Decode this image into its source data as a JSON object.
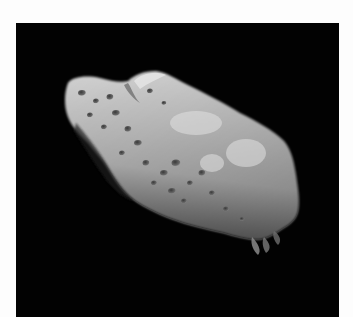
{
  "image": {
    "subject": "asteroid",
    "description": "Elongated cratered asteroid photographed against black space",
    "colors": {
      "border": "#fdfdfd",
      "space": "#020202",
      "surface_light": "#d8d8d8",
      "surface_mid": "#a9a9a9",
      "surface_shadow": "#4a4a4a"
    }
  }
}
